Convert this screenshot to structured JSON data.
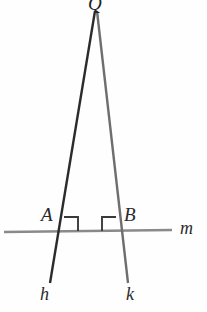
{
  "figure": {
    "background_color": "#fefefe",
    "width": 207,
    "height": 312
  },
  "labels": {
    "apex": "Q",
    "point_a": "A",
    "point_b": "B",
    "line_h": "h",
    "line_k": "k",
    "line_m": "m"
  },
  "colors": {
    "line_h": "#2b2b2b",
    "line_k": "#6e6e6e",
    "line_m": "#8a8a8a",
    "right_angle_mark": "#3a3a3a",
    "label_text": "#2a2a2a"
  },
  "geometry": {
    "apex_point": {
      "x": 96,
      "y": 11
    },
    "point_a": {
      "x": 62,
      "y": 231
    },
    "point_b": {
      "x": 118,
      "y": 231
    },
    "line_h": {
      "x1": 95,
      "y1": 11,
      "x2": 50,
      "y2": 283
    },
    "line_k": {
      "x1": 97,
      "y1": 11,
      "x2": 128,
      "y2": 283
    },
    "line_m": {
      "x1": 4,
      "y1": 232,
      "x2": 172,
      "y2": 230
    },
    "right_angle_a": {
      "x": 64,
      "y": 214,
      "size": 14
    },
    "right_angle_b": {
      "x": 102,
      "y": 214,
      "size": 14
    }
  },
  "label_positions": {
    "apex": {
      "left": 88,
      "top": -6
    },
    "point_a": {
      "left": 41,
      "top": 205
    },
    "point_b": {
      "left": 124,
      "top": 205
    },
    "line_h": {
      "left": 40,
      "top": 285
    },
    "line_k": {
      "left": 126,
      "top": 285
    },
    "line_m": {
      "left": 180,
      "top": 219
    }
  }
}
